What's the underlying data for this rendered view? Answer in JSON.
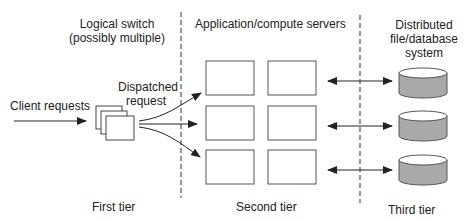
{
  "labels": {
    "logical_switch": "Logical switch",
    "logical_switch_sub": "(possibly multiple)",
    "app_servers": "Application/compute servers",
    "dfs_line1": "Distributed",
    "dfs_line2": "file/database",
    "dfs_line3": "system",
    "client_requests": "Client requests",
    "dispatched_line1": "Dispatched",
    "dispatched_line2": "request",
    "first_tier": "First tier",
    "second_tier": "Second tier",
    "third_tier": "Third tier"
  },
  "colors": {
    "line": "#222222",
    "box_stroke": "#555555",
    "cylinder_fill": "#a9a9a9",
    "cylinder_top": "#ffffff"
  },
  "servers": {
    "rows": 3,
    "cols": 2
  },
  "databases": {
    "count": 3
  }
}
